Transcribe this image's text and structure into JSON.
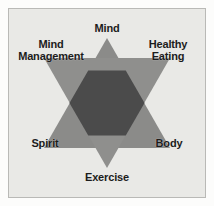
{
  "figure": {
    "background_color": "#e9e9e6",
    "frame_color": "#b9b9b6",
    "page_color": "#fcfcfb"
  },
  "chart_data": {
    "type": "diagram",
    "shape": "star-of-david",
    "title": "",
    "subtitle": "",
    "xlabel": "",
    "ylabel": "",
    "grid": false,
    "legend": null,
    "colors": {
      "triangle_arm": "#8b8b89",
      "triangle_up": "#8b8b89",
      "triangle_down": "#8f8f8d",
      "overlap_hexagon": "#4b4b4b",
      "label_text": "#1c1c1c",
      "panel_background": "#e9e9e6"
    },
    "geometry": {
      "center": [
        107,
        103
      ],
      "circumradius": 65,
      "triangle_up_vertices": [
        [
          107,
          38
        ],
        [
          170,
          148
        ],
        [
          44,
          148
        ]
      ],
      "triangle_down_vertices": [
        [
          107,
          168
        ],
        [
          44,
          58
        ],
        [
          170,
          58
        ]
      ]
    },
    "categories": [
      "Mind",
      "Healthy Eating",
      "Body",
      "Exercise",
      "Spirit",
      "Mind Management"
    ],
    "points": [
      {
        "label": "Mind",
        "position": "top",
        "triangle": "up",
        "angle_deg": 90,
        "x": 107,
        "y": 38
      },
      {
        "label": "Healthy Eating",
        "position": "upper-right",
        "triangle": "down",
        "angle_deg": 30,
        "x": 170,
        "y": 58
      },
      {
        "label": "Body",
        "position": "lower-right",
        "triangle": "up",
        "angle_deg": 330,
        "x": 170,
        "y": 148
      },
      {
        "label": "Exercise",
        "position": "bottom",
        "triangle": "down",
        "angle_deg": 270,
        "x": 107,
        "y": 168
      },
      {
        "label": "Spirit",
        "position": "lower-left",
        "triangle": "up",
        "angle_deg": 210,
        "x": 44,
        "y": 148
      },
      {
        "label": "Mind Management",
        "position": "upper-left",
        "triangle": "down",
        "angle_deg": 150,
        "x": 44,
        "y": 58
      }
    ]
  },
  "labels": {
    "mind": "Mind",
    "healthy_eating": "Healthy\nEating",
    "mind_management": "Mind\nManagement",
    "spirit": "Spirit",
    "body": "Body",
    "exercise": "Exercise"
  }
}
